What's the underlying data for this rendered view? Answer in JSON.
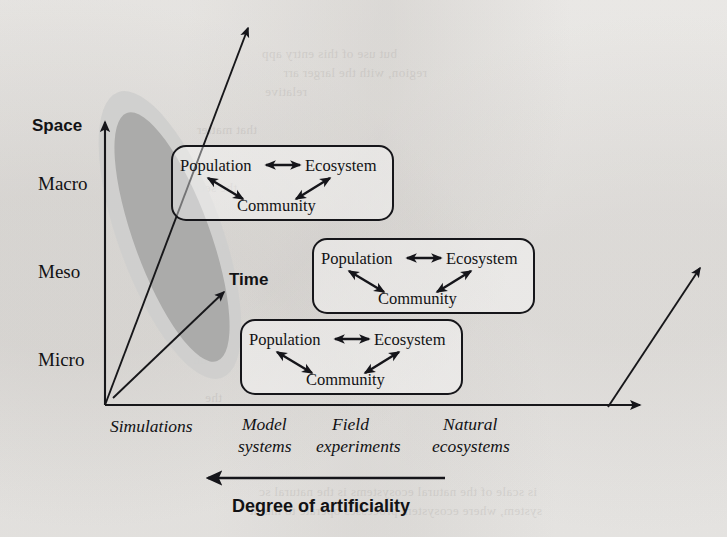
{
  "figure": {
    "type": "conceptual-axes-diagram",
    "background_color": "#f1f0ee",
    "ink_color": "#15151a"
  },
  "axes": {
    "vertical": {
      "name": "Space",
      "label": "Space",
      "tick_labels": [
        "Macro",
        "Meso",
        "Micro"
      ],
      "direction": "up",
      "arrowhead": true
    },
    "horizontal": {
      "label": "",
      "tick_labels": [
        "Simulations",
        "Model\nsystems",
        "Field\nexperiments",
        "Natural\necosystems"
      ],
      "ticks": [
        {
          "line1": "Simulations",
          "line2": ""
        },
        {
          "line1": "Model",
          "line2": "systems"
        },
        {
          "line1": "Field",
          "line2": "experiments"
        },
        {
          "line1": "Natural",
          "line2": "ecosystems"
        }
      ],
      "direction": "right",
      "arrowhead": true
    },
    "diagonal": {
      "label": "Time",
      "direction": "up-right",
      "arrowhead": true
    }
  },
  "caption": {
    "text": "Degree of artificiality",
    "arrow_direction": "left"
  },
  "triads": [
    {
      "id": "triad-macro",
      "position": "upper-left",
      "nodes": {
        "top_left": "Population",
        "top_right": "Ecosystem",
        "bottom": "Community"
      },
      "connections": [
        {
          "from": "Population",
          "to": "Ecosystem",
          "style": "double-headed"
        },
        {
          "from": "Population",
          "to": "Community",
          "style": "double-headed"
        },
        {
          "from": "Community",
          "to": "Ecosystem",
          "style": "double-headed"
        }
      ]
    },
    {
      "id": "triad-meso",
      "position": "middle-right",
      "nodes": {
        "top_left": "Population",
        "top_right": "Ecosystem",
        "bottom": "Community"
      },
      "connections": [
        {
          "from": "Population",
          "to": "Ecosystem",
          "style": "double-headed"
        },
        {
          "from": "Population",
          "to": "Community",
          "style": "double-headed"
        },
        {
          "from": "Community",
          "to": "Ecosystem",
          "style": "double-headed"
        }
      ]
    },
    {
      "id": "triad-micro",
      "position": "lower-center",
      "nodes": {
        "top_left": "Population",
        "top_right": "Ecosystem",
        "bottom": "Community"
      },
      "connections": [
        {
          "from": "Population",
          "to": "Ecosystem",
          "style": "double-headed"
        },
        {
          "from": "Population",
          "to": "Community",
          "style": "double-headed"
        },
        {
          "from": "Community",
          "to": "Ecosystem",
          "style": "double-headed"
        }
      ]
    }
  ],
  "shaded_region": {
    "description": "Nested tilted ellipses spanning micro-to-macro space along the simulations end",
    "outer_color": "#cfcfce",
    "inner_color": "#a9a9a8",
    "tilt_degrees": -22
  },
  "ghost_text": {
    "lines": [
      "but use of this entry app",
      "region, with the larger arr",
      "relative",
      "that matter",
      "the second",
      "a ecosys",
      "scale",
      "for th",
      "un",
      "the",
      "is scale of the natural ecosystems is the natural sc",
      "system, where ecosystem processes operate to maint"
    ]
  }
}
